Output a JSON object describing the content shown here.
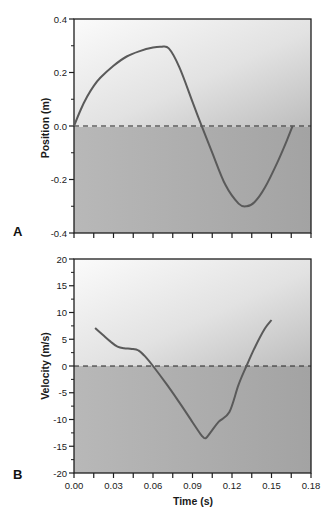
{
  "chart_data": [
    {
      "panel": "A",
      "type": "line",
      "title": "",
      "xlabel": "Time (s)",
      "ylabel": "Position (m)",
      "xlim": [
        0.0,
        0.18
      ],
      "ylim": [
        -0.4,
        0.4
      ],
      "x_ticks": [
        0.0,
        0.015,
        0.03,
        0.045,
        0.06,
        0.075,
        0.09,
        0.105,
        0.12,
        0.135,
        0.15,
        0.165,
        0.18
      ],
      "y_ticks_major": [
        0.4,
        0.2,
        0.0,
        -0.2,
        -0.4
      ],
      "y_tick_labels": [
        "0.4",
        "0.2",
        "0.0",
        "-0.2",
        "-0.4"
      ],
      "y_ticks_minor": [
        0.3,
        0.1,
        -0.1,
        -0.3
      ],
      "reference_line": {
        "y": 0.0,
        "style": "dashed"
      },
      "grid": false,
      "series": [
        {
          "name": "position",
          "x": [
            0.0,
            0.005,
            0.01,
            0.015,
            0.02,
            0.03,
            0.04,
            0.05,
            0.06,
            0.066,
            0.072,
            0.08,
            0.09,
            0.097,
            0.105,
            0.115,
            0.125,
            0.131,
            0.137,
            0.145,
            0.155,
            0.162,
            0.166
          ],
          "y": [
            0.0,
            0.06,
            0.11,
            0.15,
            0.18,
            0.225,
            0.26,
            0.28,
            0.293,
            0.296,
            0.29,
            0.22,
            0.09,
            0.0,
            -0.1,
            -0.22,
            -0.29,
            -0.3,
            -0.285,
            -0.23,
            -0.13,
            -0.05,
            0.0
          ]
        }
      ]
    },
    {
      "panel": "B",
      "type": "line",
      "title": "",
      "xlabel": "Time (s)",
      "ylabel": "Velocity (m/s)",
      "xlim": [
        0.0,
        0.18
      ],
      "ylim": [
        -20,
        20
      ],
      "x_ticks": [
        0.0,
        0.015,
        0.03,
        0.045,
        0.06,
        0.075,
        0.09,
        0.105,
        0.12,
        0.135,
        0.15,
        0.165,
        0.18
      ],
      "x_tick_labels": [
        "0.00",
        "0.03",
        "0.06",
        "0.09",
        "0.12",
        "0.15",
        "0.18"
      ],
      "x_tick_label_values": [
        0.0,
        0.03,
        0.06,
        0.09,
        0.12,
        0.15,
        0.18
      ],
      "y_ticks_major": [
        20,
        15,
        10,
        5,
        0,
        -5,
        -10,
        -15,
        -20
      ],
      "y_tick_labels": [
        "20",
        "15",
        "10",
        "5",
        "0",
        "-5",
        "-10",
        "-15",
        "-20"
      ],
      "y_ticks_minor": [
        17.5,
        12.5,
        7.5,
        2.5,
        -2.5,
        -7.5,
        -12.5,
        -17.5
      ],
      "reference_line": {
        "y": 0,
        "style": "dashed"
      },
      "grid": false,
      "series": [
        {
          "name": "velocity",
          "x": [
            0.016,
            0.022,
            0.028,
            0.033,
            0.038,
            0.044,
            0.049,
            0.054,
            0.06,
            0.07,
            0.08,
            0.09,
            0.097,
            0.1,
            0.104,
            0.11,
            0.118,
            0.125,
            0.131,
            0.138,
            0.145,
            0.15
          ],
          "y": [
            7.1,
            5.8,
            4.5,
            3.6,
            3.3,
            3.2,
            2.9,
            1.8,
            0.0,
            -3.3,
            -6.8,
            -10.5,
            -13.0,
            -13.5,
            -12.3,
            -10.4,
            -8.6,
            -3.5,
            0.0,
            3.8,
            7.0,
            8.6
          ]
        }
      ]
    }
  ],
  "panels": {
    "a": {
      "letter": "A",
      "ylabel": "Position (m)"
    },
    "b": {
      "letter": "B",
      "ylabel": "Velocity (m/s)",
      "xlabel": "Time (s)"
    }
  },
  "style": {
    "line_color": "#5a5a5a",
    "axis_color": "#1e1e1e",
    "bg_light": "#f4f4f4",
    "bg_mid": "#c9c9c9",
    "bg_dark": "#a8a8a8"
  }
}
